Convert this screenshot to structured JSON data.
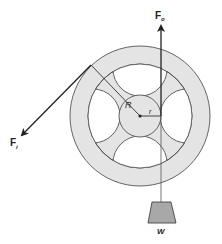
{
  "diagram": {
    "type": "wheel-and-axle",
    "colors": {
      "wheel_fill": "#e4e4e4",
      "window_fill": "#ffffff",
      "line": "#555555",
      "rope": "#333333",
      "weight_fill": "#a8a8a8"
    },
    "labels": {
      "output_force": "F",
      "output_force_sub": "o",
      "input_force": "F",
      "input_force_sub": "i",
      "big_radius": "R",
      "small_radius": "r",
      "weight": "W"
    }
  }
}
